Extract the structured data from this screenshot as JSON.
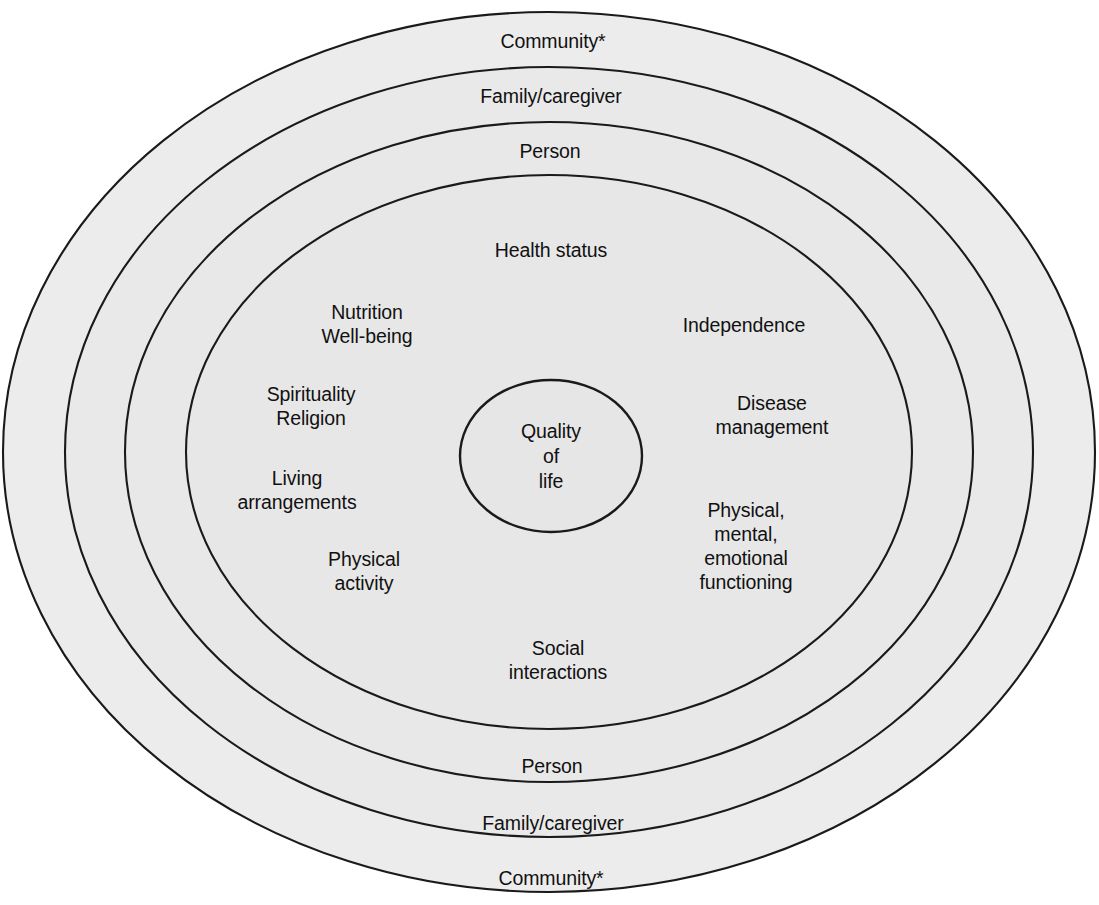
{
  "diagram": {
    "type": "concentric-ellipse-diagram",
    "geometry": {
      "center_x": 549,
      "center_y": 452,
      "rings": [
        {
          "name": "community",
          "rx": 546,
          "ry": 440
        },
        {
          "name": "family-caregiver",
          "rx": 484,
          "ry": 385
        },
        {
          "name": "person",
          "rx": 424,
          "ry": 330
        },
        {
          "name": "health-status",
          "rx": 363,
          "ry": 277
        },
        {
          "name": "quality-of-life-core",
          "rx": 91,
          "ry": 76
        }
      ]
    },
    "colors": {
      "page_background": "#ffffff",
      "ring_fill_outer": "#ececec",
      "ring_fill_2": "#e9e9e9",
      "ring_fill_3": "#e8e8e8",
      "ring_fill_inner": "#e7e7e7",
      "core_fill": "#e6e6e6",
      "stroke": "#1a1a1a",
      "text": "#111111"
    }
  },
  "rings": {
    "community_top": "Community*",
    "family_top": "Family/caregiver",
    "person_top": "Person",
    "health_status": "Health status",
    "person_bottom": "Person",
    "family_bottom": "Family/caregiver",
    "community_bottom": "Community*"
  },
  "core": {
    "label": "Quality\nof\nlife"
  },
  "domains": {
    "left": [
      {
        "id": "nutrition-wellbeing",
        "label": "Nutrition\nWell-being",
        "x": 367,
        "y": 324
      },
      {
        "id": "spirituality-religion",
        "label": "Spirituality\nReligion",
        "x": 311,
        "y": 406
      },
      {
        "id": "living-arrangements",
        "label": "Living\narrangements",
        "x": 297,
        "y": 490
      },
      {
        "id": "physical-activity",
        "label": "Physical\nactivity",
        "x": 364,
        "y": 571
      }
    ],
    "right": [
      {
        "id": "independence",
        "label": "Independence",
        "x": 744,
        "y": 325
      },
      {
        "id": "disease-management",
        "label": "Disease\nmanagement",
        "x": 772,
        "y": 415
      },
      {
        "id": "physical-mental-emotional",
        "label": "Physical,\nmental,\nemotional\nfunctioning",
        "x": 746,
        "y": 546
      }
    ]
  },
  "ring_label_positions": {
    "community_top": {
      "x": 553,
      "y": 41
    },
    "family_top": {
      "x": 551,
      "y": 96
    },
    "person_top": {
      "x": 550,
      "y": 151
    },
    "health_status": {
      "x": 551,
      "y": 250
    },
    "social_interactions": {
      "x": 558,
      "y": 660
    },
    "person_bottom": {
      "x": 552,
      "y": 766
    },
    "family_bottom": {
      "x": 553,
      "y": 823
    },
    "community_bottom": {
      "x": 551,
      "y": 878
    }
  },
  "social": {
    "label": "Social\ninteractions"
  }
}
